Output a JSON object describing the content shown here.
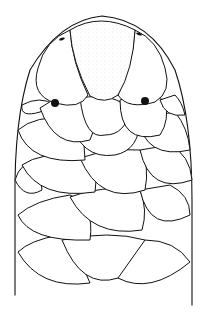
{
  "figure": {
    "colors": {
      "ink": "#111111",
      "paper": "#ffffff",
      "stipple": "#555555"
    },
    "features": {
      "rostral_scale": "large central shield with stippling",
      "eyes": 2,
      "nostrils": 2,
      "scale_rows_visible": 5
    }
  }
}
